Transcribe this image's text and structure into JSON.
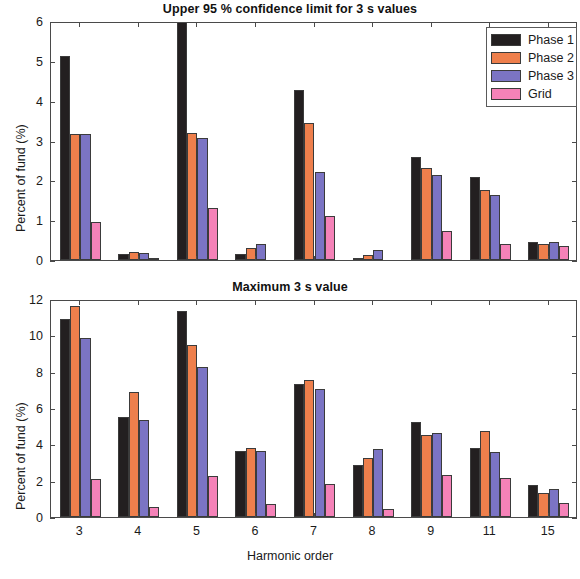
{
  "figure": {
    "width": 580,
    "height": 579,
    "background": "#ffffff"
  },
  "legend": {
    "position": "top-right",
    "entries": [
      {
        "label": "Phase 1",
        "color": "#231f20"
      },
      {
        "label": "Phase 2",
        "color": "#ee7f4c"
      },
      {
        "label": "Phase 3",
        "color": "#7b74c4"
      },
      {
        "label": "Grid",
        "color": "#f582b8"
      }
    ]
  },
  "chart_data": [
    {
      "id": "upper-95-confidence",
      "type": "bar",
      "title": "Upper 95 % confidence limit for 3 s values",
      "xlabel": "",
      "ylabel": "Percent of fund (%)",
      "categories": [
        "3",
        "4",
        "5",
        "6",
        "7",
        "8",
        "9",
        "11",
        "15"
      ],
      "ylim": [
        0,
        6
      ],
      "yticks": [
        0,
        1,
        2,
        3,
        4,
        5,
        6
      ],
      "yticklabels": [
        "0",
        "1",
        "2",
        "3",
        "4",
        "5",
        "6"
      ],
      "grid": false,
      "legend_position": "upper right",
      "series": [
        {
          "name": "Phase 1",
          "color": "#231f20",
          "values": [
            5.13,
            0.14,
            6.03,
            0.15,
            4.27,
            0.06,
            2.59,
            2.08,
            0.45
          ]
        },
        {
          "name": "Phase 2",
          "color": "#ee7f4c",
          "values": [
            3.16,
            0.21,
            3.19,
            0.3,
            3.44,
            0.12,
            2.3,
            1.76,
            0.4
          ]
        },
        {
          "name": "Phase 3",
          "color": "#7b74c4",
          "values": [
            3.16,
            0.18,
            3.06,
            0.41,
            2.2,
            0.24,
            2.13,
            1.64,
            0.45
          ]
        },
        {
          "name": "Grid",
          "color": "#f582b8",
          "values": [
            0.95,
            0.04,
            1.31,
            0.0,
            1.11,
            0.0,
            0.73,
            0.39,
            0.36
          ]
        }
      ]
    },
    {
      "id": "maximum-3s-value",
      "type": "bar",
      "title": "Maximum 3 s value",
      "xlabel": "Harmonic order",
      "ylabel": "Percent of fund (%)",
      "categories": [
        "3",
        "4",
        "5",
        "6",
        "7",
        "8",
        "9",
        "11",
        "15"
      ],
      "ylim": [
        0,
        12
      ],
      "yticks": [
        0,
        2,
        4,
        6,
        8,
        10,
        12
      ],
      "yticklabels": [
        "0",
        "2",
        "4",
        "6",
        "8",
        "10",
        "12"
      ],
      "grid": false,
      "legend_position": "none",
      "series": [
        {
          "name": "Phase 1",
          "color": "#231f20",
          "values": [
            10.88,
            5.5,
            11.33,
            3.62,
            7.32,
            2.86,
            5.25,
            3.8,
            1.77
          ]
        },
        {
          "name": "Phase 2",
          "color": "#ee7f4c",
          "values": [
            11.62,
            6.88,
            9.47,
            3.82,
            7.55,
            3.27,
            4.5,
            4.74,
            1.31
          ]
        },
        {
          "name": "Phase 3",
          "color": "#7b74c4",
          "values": [
            9.85,
            5.33,
            8.28,
            3.64,
            7.07,
            3.75,
            4.64,
            3.6,
            1.52
          ]
        },
        {
          "name": "Grid",
          "color": "#f582b8",
          "values": [
            2.12,
            0.55,
            2.25,
            0.72,
            1.82,
            0.42,
            2.31,
            2.17,
            0.78
          ]
        }
      ]
    }
  ]
}
